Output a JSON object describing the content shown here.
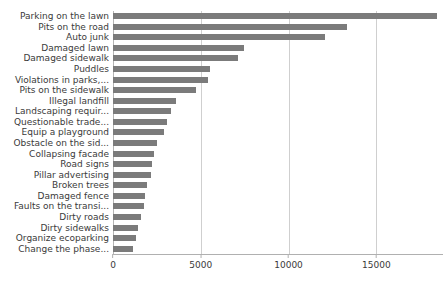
{
  "chart_data": {
    "type": "bar",
    "orientation": "horizontal",
    "title": "",
    "subtitle": "",
    "xlabel": "",
    "ylabel": "",
    "xlim": [
      0,
      18800
    ],
    "grid": true,
    "legend": null,
    "bar_color": "#7b7b7b",
    "xticks": [
      0,
      5000,
      10000,
      15000
    ],
    "xtick_labels": [
      "0",
      "5000",
      "10000",
      "15000"
    ],
    "categories": [
      "Parking on the lawn",
      "Pits on the road",
      "Auto junk",
      "Damaged lawn",
      "Damaged sidewalk",
      "Puddles",
      "Violations in parks,...",
      "Pits on the sidewalk",
      "Illegal landfill",
      "Landscaping requir...",
      "Questionable trade...",
      "Equip a playground",
      "Obstacle on the sid...",
      "Collapsing facade",
      "Road signs",
      "Pillar advertising",
      "Broken trees",
      "Damaged fence",
      "Faults on the transi...",
      "Dirty roads",
      "Dirty sidewalks",
      "Organize ecoparking",
      "Change the phase..."
    ],
    "values": [
      18450,
      13350,
      12050,
      7450,
      7100,
      5550,
      5400,
      4750,
      3600,
      3300,
      3050,
      2900,
      2500,
      2350,
      2250,
      2150,
      1950,
      1850,
      1750,
      1600,
      1450,
      1300,
      1150
    ]
  }
}
